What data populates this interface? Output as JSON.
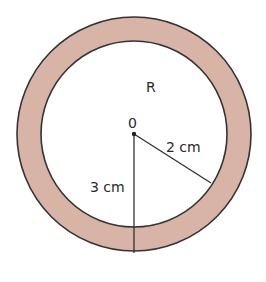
{
  "diagram": {
    "type": "annulus",
    "region_label": "R",
    "center_label": "0",
    "inner_radius_label": "2 cm",
    "outer_radius_label": "3 cm",
    "inner_radius_cm": 2,
    "outer_radius_cm": 3,
    "colors": {
      "ring_fill": "#d7b4a6",
      "stroke": "#333333",
      "background": "#ffffff"
    }
  }
}
